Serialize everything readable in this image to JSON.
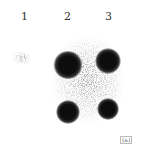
{
  "figure": {
    "lane_labels": [
      "1",
      "2",
      "3"
    ],
    "corner_mark": "(a)",
    "spots": [
      {
        "lane": "2",
        "row": "upper",
        "cx": 68,
        "cy": 65,
        "r": 13
      },
      {
        "lane": "3",
        "row": "upper",
        "cx": 108,
        "cy": 61,
        "r": 11
      },
      {
        "lane": "2",
        "row": "lower",
        "cx": 68,
        "cy": 112,
        "r": 10
      },
      {
        "lane": "3",
        "row": "lower",
        "cx": 108,
        "cy": 109,
        "r": 9
      }
    ],
    "colors": {
      "background": "#ffffff",
      "spot": "#111111"
    }
  }
}
